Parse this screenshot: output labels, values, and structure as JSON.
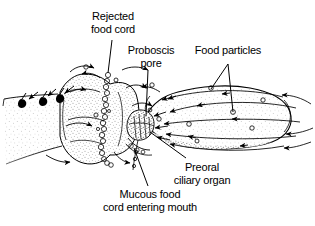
{
  "figure": {
    "background_color": "#ffffff",
    "ink_color": "#000000",
    "width": 315,
    "height": 226
  },
  "labels": {
    "rejected_food_cord": {
      "line1": "Rejected",
      "line2": "food cord"
    },
    "proboscis_pore": {
      "line1": "Proboscis",
      "line2": "pore"
    },
    "food_particles": {
      "line1": "Food particles",
      "line2": ""
    },
    "preoral_ciliary_organ": {
      "line1": "Preoral",
      "line2": "ciliary organ"
    },
    "mucous_food_cord": {
      "line1": "Mucous food",
      "line2": "cord entering mouth"
    }
  },
  "anatomy": {
    "parts": [
      "proboscis",
      "collar",
      "trunk",
      "proboscis-pore",
      "preoral-ciliary-organ",
      "mouth",
      "rejected-food-cord",
      "mucous-food-cord"
    ]
  },
  "flow": {
    "description": "Ciliary water currents over proboscis surface carrying food particles toward the mouth",
    "arrow_count": 26,
    "food_particle_count": 12,
    "rejected_particle_count": 3
  }
}
